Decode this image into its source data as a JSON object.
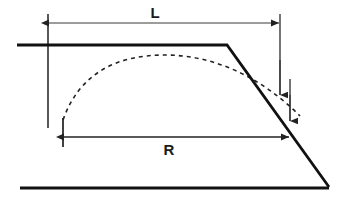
{
  "diagram": {
    "background_color": "#ffffff",
    "line_color": "#111111",
    "dimension_color": "#3a3a3a",
    "dashed_color": "#222222",
    "labels": {
      "length_label": "L",
      "radius_label": "R"
    },
    "geometry": {
      "top_surface": {
        "x1": 17,
        "y1": 45,
        "x2": 227,
        "y2": 45
      },
      "slope_face": {
        "x1": 227,
        "y1": 45,
        "x2": 329,
        "y2": 187
      },
      "base_line": {
        "x1": 20,
        "y1": 188,
        "x2": 329,
        "y2": 188
      },
      "dashed_arc": {
        "start_x": 63,
        "start_y": 120,
        "peak_x": 165,
        "peak_y": 55,
        "end_x": 300,
        "end_y": 116
      },
      "extension_left": {
        "x": 48,
        "y_top": 14,
        "y_bottom": 128
      },
      "extension_right_L": {
        "x": 280,
        "y_top": 14,
        "y_bottom": 95
      },
      "extension_right_R": {
        "x": 290,
        "y_top": 79,
        "y_bottom": 121
      },
      "tick_R_left": {
        "x": 63,
        "y_top": 118,
        "y_bottom": 147
      },
      "dimension_line_L": {
        "x1": 48,
        "x2": 280,
        "y": 23
      },
      "dimension_line_R": {
        "x1": 63,
        "x2": 289,
        "y": 137
      }
    },
    "label_positions": {
      "L": {
        "x": 155,
        "y": 14
      },
      "R": {
        "x": 169,
        "y": 150
      }
    }
  }
}
